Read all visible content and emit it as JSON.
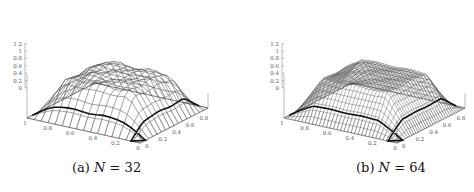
{
  "figure": {
    "panels": [
      {
        "id": "a",
        "label": "(a)",
        "variable": "N",
        "equals": "=",
        "value": "32",
        "grid_n": 16
      },
      {
        "id": "b",
        "label": "(b)",
        "variable": "N",
        "equals": "=",
        "value": "64",
        "grid_n": 32
      }
    ]
  },
  "chart_data": [
    {
      "type": "surface3d",
      "title": "(a) N = 32",
      "zlabel_ticks": [
        "0",
        "0.2",
        "0.4",
        "0.6",
        "0.8",
        "1",
        "1.2"
      ],
      "x_ticks": [
        "1",
        "0.8",
        "0.6",
        "0.4",
        "0.2",
        "0"
      ],
      "y_ticks": [
        "0",
        "0.2",
        "0.4",
        "0.6",
        "0.8"
      ],
      "zlim": [
        0,
        1.2
      ],
      "xlim": [
        0,
        1
      ],
      "ylim": [
        0,
        1
      ],
      "description": "Wireframe mesh surface, plateau near z≈1 in interior, falling to 0 at boundaries; front edge ridge ≈0.6 with a dip ≈0.1 at the front corner",
      "grid": "16x16 mesh"
    },
    {
      "type": "surface3d",
      "title": "(b) N = 64",
      "zlabel_ticks": [
        "0",
        "0.2",
        "0.4",
        "0.6",
        "0.8",
        "1",
        "1.2"
      ],
      "x_ticks": [
        "1",
        "0.8",
        "0.6",
        "0.4",
        "0.2",
        "0"
      ],
      "y_ticks": [
        "0",
        "0.2",
        "0.4",
        "0.6",
        "0.8"
      ],
      "zlim": [
        0,
        1.2
      ],
      "xlim": [
        0,
        1
      ],
      "ylim": [
        0,
        1
      ],
      "description": "Finer wireframe mesh surface, plateau near z≈1, smoother boundary ridge ≈0.6",
      "grid": "32x32 mesh"
    }
  ]
}
